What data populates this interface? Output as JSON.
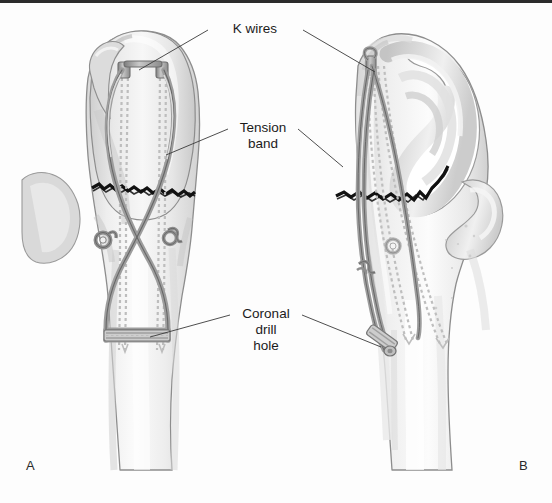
{
  "figure": {
    "background_color": "#fdfdfd",
    "border_color": "#2b2b2b",
    "panels": [
      {
        "id": "A",
        "letter": "A",
        "view": "posterior",
        "x": 26,
        "y": 470
      },
      {
        "id": "B",
        "letter": "B",
        "view": "lateral",
        "x": 519,
        "y": 470
      }
    ],
    "labels": [
      {
        "id": "k-wires",
        "lines": [
          "K wires"
        ],
        "x": 255,
        "y": 33,
        "leaders": [
          {
            "to_x": 139,
            "to_y": 70,
            "from_x": 208,
            "from_y": 30
          },
          {
            "to_x": 375,
            "to_y": 72,
            "from_x": 303,
            "from_y": 30
          }
        ]
      },
      {
        "id": "tension-band",
        "lines": [
          "Tension",
          "band"
        ],
        "x": 263,
        "y": 132,
        "leaders": [
          {
            "to_x": 166,
            "to_y": 155,
            "from_x": 228,
            "from_y": 129
          },
          {
            "to_x": 343,
            "to_y": 167,
            "from_x": 298,
            "from_y": 129
          }
        ]
      },
      {
        "id": "coronal-drill-hole",
        "lines": [
          "Coronal",
          "drill",
          "hole"
        ],
        "x": 266,
        "y": 318,
        "leaders": [
          {
            "to_x": 150,
            "to_y": 337,
            "from_x": 230,
            "from_y": 315
          },
          {
            "to_x": 381,
            "to_y": 347,
            "from_x": 302,
            "from_y": 315
          }
        ]
      }
    ],
    "colors": {
      "bone_outline": "#8d8d8d",
      "bone_fill_light": "#f3f3f3",
      "bone_fill_mid": "#e2e2e2",
      "bone_fill_dark": "#cfcfcf",
      "cartilage": "#d6d6d6",
      "wire": "#9a9a9a",
      "wire_outline": "#6f6f6f",
      "fracture": "#121212",
      "kwire_dashed": "#b8b8b8",
      "label_text": "#1b1b1b",
      "leader_line": "#3a3a3a"
    },
    "anatomy": {
      "bone": "ulna (proximal)",
      "structures": [
        "olecranon process",
        "semilunar (trochlear) notch",
        "coronoid process",
        "ulnar shaft",
        "transverse olecranon fracture"
      ]
    },
    "hardware": {
      "k_wires_count": 2,
      "tension_band_pattern": "figure-of-eight",
      "twist_knots": 2,
      "coronal_drill_hole_count": 1
    }
  }
}
